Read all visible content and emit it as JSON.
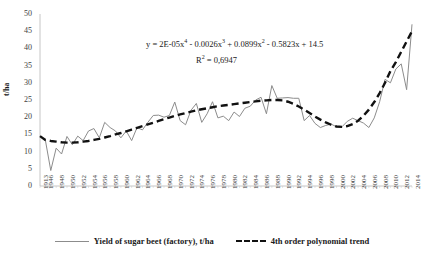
{
  "chart_data": {
    "type": "line",
    "title": "",
    "xlabel": "",
    "ylabel": "t/ha",
    "ylim": [
      0,
      50
    ],
    "ytick_step": 5,
    "yticks": [
      "0",
      "5",
      "10",
      "15",
      "20",
      "25",
      "30",
      "35",
      "40",
      "45",
      "50"
    ],
    "grid": false,
    "legend_position": "bottom",
    "annotations": {
      "equation": "y = 2E-05x⁴ - 0.0026x³ + 0.0899x² - 0.5823x + 14.5",
      "equation_parts": {
        "lead": "y = 2E-05x",
        "e1": "4",
        "t2": " - 0.0026x",
        "e2": "3",
        "t3": " + 0.0899x",
        "e3": "2",
        "t4": " - 0.5823x + 14.5"
      },
      "r_squared_label": "R",
      "r_squared_exp": "2",
      "r_squared_value": " = 0,6947"
    },
    "x": [
      1913,
      1946,
      1947,
      1948,
      1949,
      1950,
      1951,
      1952,
      1953,
      1954,
      1955,
      1956,
      1957,
      1958,
      1959,
      1960,
      1961,
      1962,
      1963,
      1964,
      1965,
      1966,
      1967,
      1968,
      1969,
      1970,
      1971,
      1972,
      1973,
      1974,
      1975,
      1976,
      1977,
      1978,
      1979,
      1980,
      1981,
      1982,
      1983,
      1984,
      1985,
      1986,
      1987,
      1988,
      1989,
      1990,
      1991,
      1992,
      1993,
      1994,
      1995,
      1996,
      1997,
      1998,
      1999,
      2000,
      2001,
      2002,
      2003,
      2004,
      2005,
      2006,
      2007,
      2008,
      2009,
      2010,
      2011,
      2012,
      2013,
      2014
    ],
    "xtick_labels": [
      "1913",
      "1946",
      "1948",
      "1950",
      "1952",
      "1954",
      "1956",
      "1958",
      "1960",
      "1962",
      "1964",
      "1966",
      "1968",
      "1970",
      "1972",
      "1974",
      "1976",
      "1978",
      "1980",
      "1982",
      "1984",
      "1986",
      "1988",
      "1990",
      "1992",
      "1994",
      "1996",
      "1998",
      "2000",
      "2002",
      "2004",
      "2006",
      "2008",
      "2010",
      "2012",
      "2014"
    ],
    "series": [
      {
        "name": "Yield of sugar beet (factory), t/ha",
        "style": "solid",
        "color": "#8c8c8c",
        "values": [
          14.5,
          13.3,
          4.5,
          11.0,
          9.3,
          14.4,
          12.0,
          14.5,
          13.2,
          16.0,
          16.7,
          14.0,
          18.5,
          17.0,
          16.0,
          14.0,
          16.0,
          13.2,
          17.0,
          16.3,
          18.5,
          20.5,
          20.6,
          20.0,
          20.5,
          24.4,
          19.0,
          17.8,
          22.0,
          24.0,
          18.5,
          21.0,
          24.5,
          19.8,
          20.3,
          19.0,
          21.5,
          20.2,
          22.6,
          23.2,
          25.0,
          25.8,
          21.0,
          29.2,
          25.5,
          25.6,
          25.7,
          25.5,
          25.5,
          19.0,
          20.5,
          18.2,
          17.0,
          17.6,
          18.0,
          17.2,
          17.2,
          18.8,
          19.7,
          19.0,
          18.3,
          17.0,
          19.8,
          24.5,
          31.0,
          30.0,
          34.0,
          35.5,
          28.0,
          47.0
        ]
      },
      {
        "name": "4th order polynomial trend",
        "style": "dashed",
        "color": "#111111",
        "values": [
          14.5,
          13.4,
          13.1,
          12.9,
          12.7,
          12.6,
          12.6,
          12.7,
          12.9,
          13.1,
          13.4,
          13.7,
          14.1,
          14.5,
          15.0,
          15.4,
          15.9,
          16.4,
          16.9,
          17.4,
          17.9,
          18.4,
          18.9,
          19.4,
          19.9,
          20.4,
          20.8,
          21.2,
          21.6,
          22.0,
          22.3,
          22.6,
          22.9,
          23.2,
          23.4,
          23.6,
          23.8,
          24.0,
          24.2,
          24.4,
          24.6,
          24.8,
          24.9,
          25.0,
          25.0,
          24.9,
          24.5,
          23.9,
          23.1,
          22.2,
          21.2,
          20.2,
          19.3,
          18.5,
          17.8,
          17.3,
          17.2,
          17.4,
          18.0,
          19.0,
          20.4,
          22.2,
          24.4,
          27.0,
          30.0,
          33.4,
          36.0,
          39.0,
          42.0,
          45.0
        ]
      }
    ]
  },
  "legend": {
    "items": [
      {
        "label": "Yield of sugar beet (factory), t/ha",
        "marker": "solid-line-gray"
      },
      {
        "label": "4th order polynomial trend",
        "marker": "dashed-line-black"
      }
    ]
  }
}
